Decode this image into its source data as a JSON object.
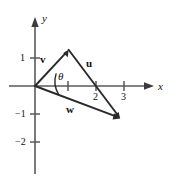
{
  "figure": {
    "kind": "vector-diagram",
    "background_color": "#ffffff",
    "axis_color": "#5a5a5a",
    "vector_color": "#2a2a2a"
  },
  "axes": {
    "x_label": "x",
    "y_label": "y",
    "origin": {
      "x": 35,
      "y": 86
    },
    "unit_px": 29,
    "x_ticks": [
      {
        "value": 1,
        "label": "",
        "px": 68
      },
      {
        "value": 2,
        "label": "2",
        "px": 96
      },
      {
        "value": 3,
        "label": "3",
        "px": 124
      }
    ],
    "y_ticks": [
      {
        "value": 1,
        "label": "1",
        "px": 58
      },
      {
        "value": -1,
        "label": "−1",
        "px": 114
      },
      {
        "value": -2,
        "label": "−2",
        "px": 142
      }
    ],
    "x_range": [
      -0.25,
      4.3
    ],
    "y_range": [
      -3.1,
      1.6
    ]
  },
  "vectors": [
    {
      "name": "v",
      "label": "v",
      "from": {
        "x": 0,
        "y": 0
      },
      "to": {
        "x": 1.14,
        "y": 1.24
      },
      "label_pos": {
        "left": 40,
        "top": 54
      }
    },
    {
      "name": "u",
      "label": "u",
      "from": {
        "x": 1.14,
        "y": 1.24
      },
      "to": {
        "x": 2.93,
        "y": -1.1
      },
      "label_pos": {
        "left": 86,
        "top": 58
      }
    },
    {
      "name": "w",
      "label": "w",
      "from": {
        "x": 0,
        "y": 0
      },
      "to": {
        "x": 2.93,
        "y": -1.1
      },
      "label_pos": {
        "left": 66,
        "top": 104
      }
    }
  ],
  "angle": {
    "symbol": "θ",
    "between": [
      "v",
      "w"
    ],
    "vertex": {
      "x": 0,
      "y": 0
    },
    "label_pos": {
      "left": 58,
      "top": 71
    }
  }
}
